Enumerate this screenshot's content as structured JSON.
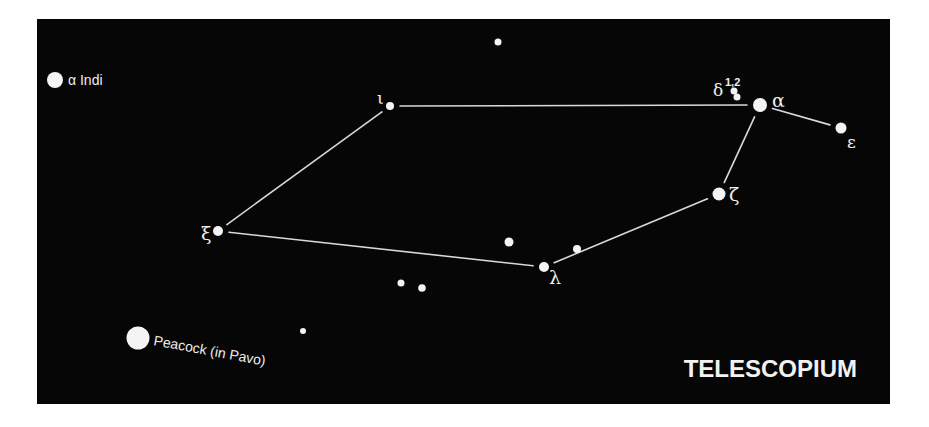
{
  "diagram": {
    "title": "TELESCOPIUM",
    "colors": {
      "background": "#060606",
      "star": "#f4f4f4",
      "line": "#d9d9d9",
      "text": "#eeeeee"
    },
    "stars": [
      {
        "id": "alpha",
        "label": "α",
        "magnitude_class": "bright"
      },
      {
        "id": "delta1",
        "label": "δ",
        "superscript": "1,2",
        "magnitude_class": "faint"
      },
      {
        "id": "delta2",
        "label": "",
        "magnitude_class": "faint"
      },
      {
        "id": "epsilon",
        "label": "ε",
        "magnitude_class": "medium"
      },
      {
        "id": "zeta",
        "label": "ζ",
        "magnitude_class": "bright"
      },
      {
        "id": "iota",
        "label": "ι",
        "magnitude_class": "faint"
      },
      {
        "id": "xi",
        "label": "ξ",
        "magnitude_class": "medium"
      },
      {
        "id": "lambda",
        "label": "λ",
        "magnitude_class": "medium"
      },
      {
        "id": "unlabeled-near-zeta",
        "label": "",
        "magnitude_class": "faint"
      },
      {
        "id": "unlabeled-mid",
        "label": "",
        "magnitude_class": "medium"
      },
      {
        "id": "unlabeled-top",
        "label": "",
        "magnitude_class": "faint"
      },
      {
        "id": "unlabeled-pair-1",
        "label": "",
        "magnitude_class": "faint"
      },
      {
        "id": "unlabeled-pair-2",
        "label": "",
        "magnitude_class": "faint"
      },
      {
        "id": "unlabeled-low",
        "label": "",
        "magnitude_class": "faint"
      }
    ],
    "reference_stars": [
      {
        "id": "alpha-indi",
        "label": "α Indi"
      },
      {
        "id": "peacock",
        "label": "Peacock (in Pavo)"
      }
    ],
    "lines": [
      [
        "iota",
        "alpha"
      ],
      [
        "alpha",
        "epsilon"
      ],
      [
        "alpha",
        "zeta"
      ],
      [
        "zeta",
        "lambda"
      ],
      [
        "lambda",
        "xi"
      ],
      [
        "xi",
        "iota"
      ]
    ]
  }
}
